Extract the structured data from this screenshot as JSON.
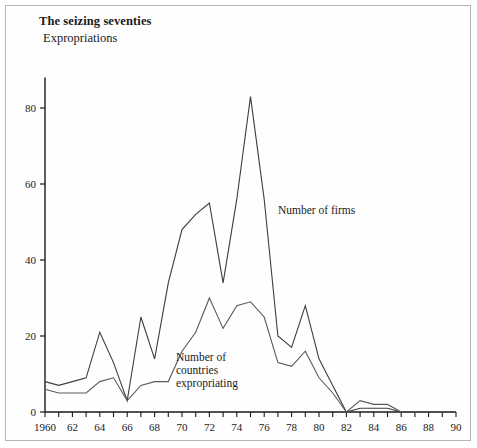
{
  "header": {
    "title": "The seizing seventies",
    "subtitle": "Expropriations"
  },
  "labels": {
    "firms": "Number of firms",
    "countries_line1": "Number of",
    "countries_line2": "countries",
    "countries_line3": "expropriating"
  },
  "chart_data": {
    "type": "line",
    "title": "The seizing seventies",
    "subtitle": "Expropriations",
    "xlabel": "",
    "ylabel": "",
    "xlim": [
      1960,
      1990
    ],
    "ylim": [
      0,
      88
    ],
    "yticks": [
      0,
      20,
      40,
      60,
      80
    ],
    "xticks": [
      1960,
      1961,
      1962,
      1963,
      1964,
      1965,
      1966,
      1967,
      1968,
      1969,
      1970,
      1971,
      1972,
      1973,
      1974,
      1975,
      1976,
      1977,
      1978,
      1979,
      1980,
      1981,
      1982,
      1983,
      1984,
      1985,
      1986,
      1987,
      1988,
      1989,
      1990
    ],
    "xtick_labels": [
      "1960",
      "",
      "62",
      "",
      "64",
      "",
      "66",
      "",
      "68",
      "",
      "70",
      "",
      "72",
      "",
      "74",
      "",
      "76",
      "",
      "78",
      "",
      "80",
      "",
      "82",
      "",
      "84",
      "",
      "86",
      "",
      "88",
      "",
      "90"
    ],
    "grid": false,
    "legend_position": "inline-annotation",
    "x": [
      1960,
      1961,
      1962,
      1963,
      1964,
      1965,
      1966,
      1967,
      1968,
      1969,
      1970,
      1971,
      1972,
      1973,
      1974,
      1975,
      1976,
      1977,
      1978,
      1979,
      1980,
      1981,
      1982,
      1983,
      1984,
      1985,
      1986,
      1987,
      1988,
      1989,
      1990
    ],
    "series": [
      {
        "name": "Number of firms",
        "color": "#3c3c3c",
        "values": [
          8,
          7,
          8,
          9,
          21,
          13,
          3,
          25,
          14,
          34,
          48,
          52,
          55,
          34,
          56,
          83,
          56,
          20,
          17,
          28,
          14,
          7,
          0,
          1,
          1,
          1,
          0,
          0,
          0,
          0,
          0
        ]
      },
      {
        "name": "Number of countries expropriating",
        "color": "#5a5a5a",
        "values": [
          6,
          5,
          5,
          5,
          8,
          9,
          3,
          7,
          8,
          8,
          16,
          21,
          30,
          22,
          28,
          29,
          25,
          13,
          12,
          16,
          9,
          5,
          0,
          3,
          2,
          2,
          0,
          0,
          0,
          0,
          0
        ]
      }
    ]
  },
  "axis_geometry": {
    "x0_px": 44,
    "x1_px": 455,
    "y0_px": 411,
    "y_per_unit_px": 3.8
  }
}
